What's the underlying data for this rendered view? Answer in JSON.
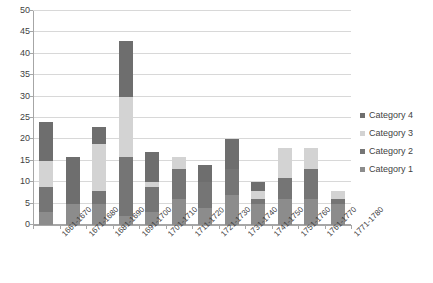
{
  "chart_data": {
    "type": "bar",
    "subtype": "stacked-column",
    "title": "",
    "subtitle": "",
    "xlabel": "",
    "ylabel": "",
    "ylim": [
      0,
      50
    ],
    "y_ticks": [
      0,
      5,
      10,
      15,
      20,
      25,
      30,
      35,
      40,
      45,
      50
    ],
    "grid": true,
    "legend_position": "right",
    "categories": [
      "1661-1670",
      "1671-1680",
      "1681-1690",
      "1691-1700",
      "1701-1710",
      "1711-1720",
      "1721-1730",
      "1731-1740",
      "1741-1750",
      "1751-1760",
      "1761-1770",
      "1771-1780"
    ],
    "series": [
      {
        "name": "Category 1",
        "color": "#8c8c8c",
        "values": [
          3,
          5,
          5,
          2,
          3,
          6,
          4,
          7,
          5,
          6,
          6,
          5
        ]
      },
      {
        "name": "Category 2",
        "color": "#757575",
        "values": [
          6,
          0,
          3,
          14,
          6,
          7,
          6,
          6,
          1,
          5,
          7,
          1
        ]
      },
      {
        "name": "Category 3",
        "color": "#d3d3d3",
        "values": [
          6,
          0,
          11,
          14,
          1,
          3,
          0,
          0,
          2,
          7,
          5,
          2
        ]
      },
      {
        "name": "Category 4",
        "color": "#6e6e6e",
        "values": [
          9,
          11,
          4,
          13,
          7,
          0,
          4,
          7,
          2,
          0,
          0,
          0
        ]
      }
    ],
    "totals": [
      24,
      16,
      23,
      43,
      17,
      16,
      14,
      20,
      10,
      18,
      18,
      8
    ]
  },
  "legend": {
    "entries": [
      {
        "label": "Category 4",
        "color": "#6e6e6e"
      },
      {
        "label": "Category 3",
        "color": "#d3d3d3"
      },
      {
        "label": "Category 2",
        "color": "#757575"
      },
      {
        "label": "Category 1",
        "color": "#8c8c8c"
      }
    ]
  },
  "colors": {
    "gridline": "#d8d8d8",
    "axis": "#a6a6a6",
    "text": "#3f3f3f",
    "background": "#ffffff"
  }
}
